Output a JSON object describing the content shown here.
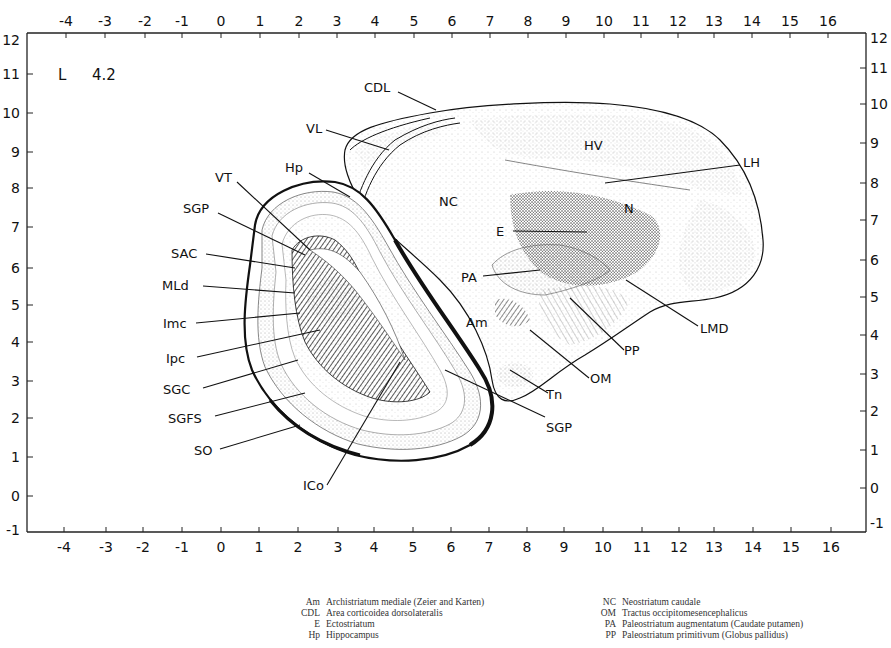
{
  "figure": {
    "section_label": "L",
    "section_value": "4.2",
    "x_axis": {
      "ticks": [
        "-4",
        "-3",
        "-2",
        "-1",
        "0",
        "1",
        "2",
        "3",
        "4",
        "5",
        "6",
        "7",
        "8",
        "9",
        "10",
        "11",
        "12",
        "13",
        "14",
        "15",
        "16"
      ],
      "range": [
        -4.5,
        17.5
      ]
    },
    "y_axis": {
      "ticks": [
        "12",
        "11",
        "10",
        "9",
        "8",
        "7",
        "6",
        "5",
        "4",
        "3",
        "2",
        "1",
        "0",
        "-1"
      ],
      "range": [
        -1,
        12
      ]
    },
    "labels": {
      "CDL": "CDL",
      "VL": "VL",
      "Hp": "Hp",
      "VT": "VT",
      "SGP_top": "SGP",
      "SAC": "SAC",
      "MLd": "MLd",
      "Imc": "Imc",
      "Ipc": "Ipc",
      "SGC": "SGC",
      "SGFS": "SGFS",
      "SO": "SO",
      "ICo": "ICo",
      "SGP_bottom": "SGP",
      "NC": "NC",
      "HV": "HV",
      "N": "N",
      "LH": "LH",
      "E": "E",
      "PA": "PA",
      "Am": "Am",
      "LMD": "LMD",
      "PP": "PP",
      "OM": "OM",
      "Tn": "Tn"
    }
  },
  "legend": {
    "left": [
      {
        "abbr": "Am",
        "text": "Archistriatum mediale (Zeier and Karten)"
      },
      {
        "abbr": "CDL",
        "text": "Area corticoidea dorsolateralis"
      },
      {
        "abbr": "E",
        "text": "Ectostriatum"
      },
      {
        "abbr": "Hp",
        "text": "Hippocampus"
      }
    ],
    "right": [
      {
        "abbr": "NC",
        "text": "Neostriatum caudale"
      },
      {
        "abbr": "OM",
        "text": "Tractus occipitomesencephalicus"
      },
      {
        "abbr": "PA",
        "text": "Paleostriatum augmentatum (Caudate putamen)"
      },
      {
        "abbr": "PP",
        "text": "Paleostriatum primitivum (Globus pallidus)"
      }
    ]
  }
}
